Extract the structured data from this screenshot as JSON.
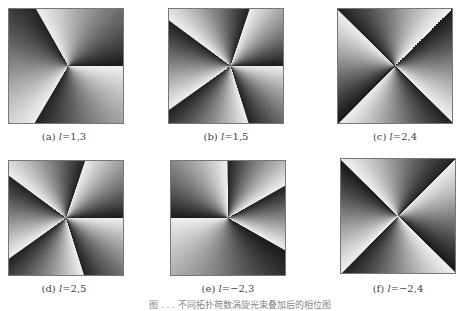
{
  "figure": {
    "panels": [
      {
        "id": "a",
        "label": "(a)",
        "var": "l",
        "value": "=1,3",
        "pattern": "phase-1-3"
      },
      {
        "id": "b",
        "label": "(b)",
        "var": "l",
        "value": "=1,5",
        "pattern": "phase-1-5"
      },
      {
        "id": "c",
        "label": "(c)",
        "var": "l",
        "value": "=2,4",
        "pattern": "phase-2-4"
      },
      {
        "id": "d",
        "label": "(d)",
        "var": "l",
        "value": "=2,5",
        "pattern": "phase-2-5"
      },
      {
        "id": "e",
        "label": "(e)",
        "var": "l",
        "value": "=−2,3",
        "pattern": "phase-neg2-3"
      },
      {
        "id": "f",
        "label": "(f)",
        "var": "l",
        "value": "=−2,4",
        "pattern": "phase-neg2-4"
      }
    ],
    "caption": "图 . . .  不同拓扑荷数涡旋光束叠加后的相位图"
  }
}
